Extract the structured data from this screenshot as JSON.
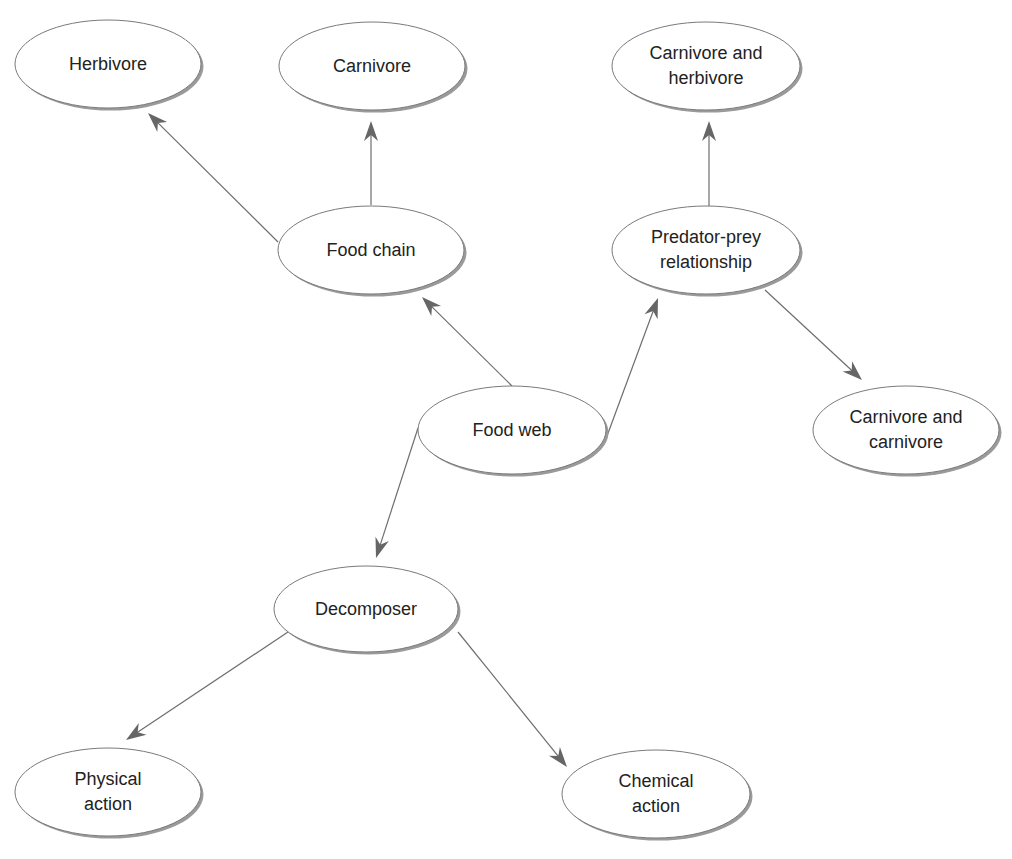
{
  "diagram": {
    "type": "concept-map",
    "colors": {
      "background": "#ffffff",
      "node_fill": "#ffffff",
      "node_stroke": "#7a7a7a",
      "node_shadow": "#9a9a9a",
      "edge": "#6e6e6e",
      "text": "#222222"
    },
    "nodes": [
      {
        "id": "herbivore",
        "label": "Herbivore",
        "cx": 108,
        "cy": 64,
        "rx": 93,
        "ry": 44
      },
      {
        "id": "carnivore",
        "label": "Carnivore",
        "cx": 372,
        "cy": 66,
        "rx": 93,
        "ry": 44
      },
      {
        "id": "carnivore-and-herbivore",
        "label": "Carnivore and\nherbivore",
        "cx": 706,
        "cy": 66,
        "rx": 94,
        "ry": 44
      },
      {
        "id": "food-chain",
        "label": "Food chain",
        "cx": 371,
        "cy": 250,
        "rx": 93,
        "ry": 44
      },
      {
        "id": "predator-prey-relationship",
        "label": "Predator-prey\nrelationship",
        "cx": 706,
        "cy": 250,
        "rx": 94,
        "ry": 44
      },
      {
        "id": "food-web",
        "label": "Food web",
        "cx": 512,
        "cy": 430,
        "rx": 94,
        "ry": 44
      },
      {
        "id": "carnivore-and-carnivore",
        "label": "Carnivore and\ncarnivore",
        "cx": 906,
        "cy": 430,
        "rx": 93,
        "ry": 44
      },
      {
        "id": "decomposer",
        "label": "Decomposer",
        "cx": 366,
        "cy": 609,
        "rx": 92,
        "ry": 43
      },
      {
        "id": "physical-action",
        "label": "Physical\naction",
        "cx": 108,
        "cy": 792,
        "rx": 93,
        "ry": 44
      },
      {
        "id": "chemical-action",
        "label": "Chemical\naction",
        "cx": 656,
        "cy": 794,
        "rx": 94,
        "ry": 44
      }
    ],
    "edges": [
      {
        "from": "food-chain",
        "to": "herbivore",
        "x1": 278,
        "y1": 242,
        "x2": 148,
        "y2": 113
      },
      {
        "from": "food-chain",
        "to": "carnivore",
        "x1": 371,
        "y1": 205,
        "x2": 371,
        "y2": 121
      },
      {
        "from": "food-web",
        "to": "food-chain",
        "x1": 512,
        "y1": 386,
        "x2": 422,
        "y2": 297
      },
      {
        "from": "food-web",
        "to": "predator-prey-relationship",
        "x1": 607,
        "y1": 436,
        "x2": 658,
        "y2": 298
      },
      {
        "from": "predator-prey-relationship",
        "to": "carnivore-and-herbivore",
        "x1": 709,
        "y1": 206,
        "x2": 709,
        "y2": 121
      },
      {
        "from": "predator-prey-relationship",
        "to": "carnivore-and-carnivore",
        "x1": 765,
        "y1": 290,
        "x2": 862,
        "y2": 380
      },
      {
        "from": "food-web",
        "to": "decomposer",
        "x1": 418,
        "y1": 428,
        "x2": 376,
        "y2": 558
      },
      {
        "from": "decomposer",
        "to": "physical-action",
        "x1": 288,
        "y1": 632,
        "x2": 126,
        "y2": 740
      },
      {
        "from": "decomposer",
        "to": "chemical-action",
        "x1": 458,
        "y1": 632,
        "x2": 567,
        "y2": 767
      }
    ]
  }
}
